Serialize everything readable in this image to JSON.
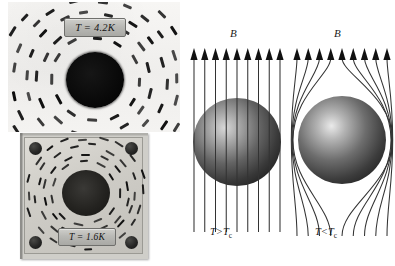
{
  "figure": {
    "topic": "Meissner effect comparison",
    "panels": [
      {
        "id": "photo-normal",
        "kind": "photograph",
        "label": "T = 4.2K",
        "description": "iron-filing magnetic field pattern, normal state"
      },
      {
        "id": "photo-superconducting",
        "kind": "photograph",
        "label": "T = 1.6K",
        "description": "iron-filing magnetic field pattern, superconducting state"
      },
      {
        "id": "schematic-normal",
        "kind": "diagram",
        "field_label": "B",
        "state_label": "T>T",
        "state_sub": "c",
        "field_lines": 9,
        "field_line_style": "straight-through-sphere"
      },
      {
        "id": "schematic-superconducting",
        "kind": "diagram",
        "field_label": "B",
        "state_label": "T<T",
        "state_sub": "c",
        "field_lines": 9,
        "field_line_style": "expelled-around-sphere"
      }
    ],
    "colors": {
      "background": "#ffffff",
      "field_line": "#3a3a3a",
      "sphere_dark": "#2b2b2b",
      "sphere_highlight": "#e8e8e8",
      "disk_black": "#000000",
      "plate_gray": "#cfcdc7",
      "chip_gray": "#b9b9b5",
      "text": "#1a1a1a"
    }
  }
}
